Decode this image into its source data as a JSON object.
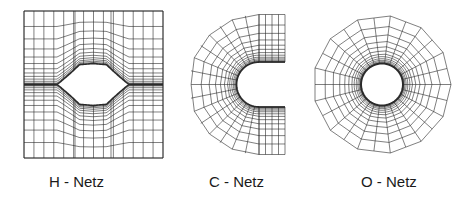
{
  "diagram": {
    "line_color": "#2a2a2a",
    "background": "#ffffff",
    "panels": [
      {
        "id": "h",
        "label": "H - Netz",
        "label_x": 49,
        "type": "H-grid",
        "bounds": {
          "x0": 24,
          "y0": 11,
          "x1": 163,
          "y1": 158
        },
        "bump": {
          "cx": 93,
          "half_width": 36,
          "height": 21,
          "center_y": 84.5
        }
      },
      {
        "id": "c",
        "label": "C - Netz",
        "label_x": 209,
        "type": "C-grid",
        "inner": {
          "cx": 259,
          "cy": 84.5,
          "r": 22.5,
          "x_end": 285
        },
        "outer": {
          "cx": 259,
          "cy": 84.5,
          "r": 70,
          "x_right": 285
        }
      },
      {
        "id": "o",
        "label": "O - Netz",
        "label_x": 361,
        "type": "O-grid",
        "center": {
          "cx": 382,
          "cy": 84.5
        },
        "inner_r": 21,
        "outer_r": 69,
        "sides": 13
      }
    ]
  }
}
